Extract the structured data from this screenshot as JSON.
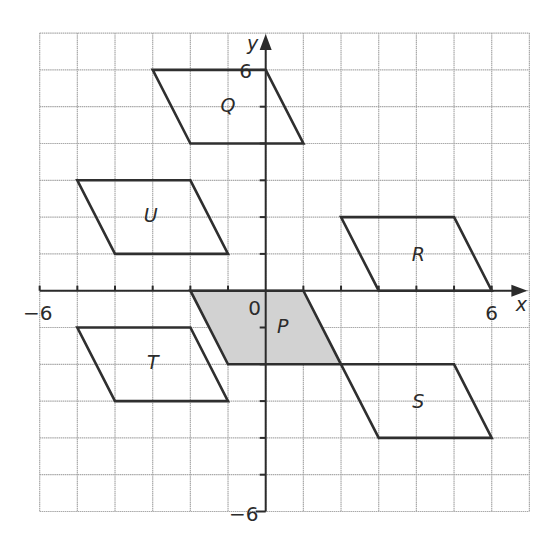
{
  "diagram": {
    "type": "coordinate-grid-transformations",
    "colors": {
      "background": "#ffffff",
      "grid_line": "#a9a9a9",
      "axis": "#2b2b2b",
      "shape_stroke": "#2f2f2f",
      "shaded_fill": "#d2d2d2",
      "text": "#2b2b2b"
    },
    "grid": {
      "x_min": -6,
      "x_max": 7,
      "y_min": -6,
      "y_max": 7,
      "origin_px": [
        265.7,
        290.7
      ],
      "cell_w_px": 37.67,
      "cell_h_px": 36.8
    },
    "axes": {
      "x_label": "x",
      "y_label": "y",
      "origin_label": "0",
      "x_tick_labels": [
        {
          "value": -6,
          "text": "−6"
        },
        {
          "value": 6,
          "text": "6"
        }
      ],
      "y_tick_labels": [
        {
          "value": 6,
          "text": "6"
        },
        {
          "value": -6,
          "text": "−6"
        }
      ]
    },
    "shapes": [
      {
        "name": "P",
        "shaded": true,
        "vertices": [
          [
            -2,
            0
          ],
          [
            1,
            0
          ],
          [
            2,
            -2
          ],
          [
            -1,
            -2
          ]
        ],
        "label_at": [
          0.45,
          -0.95
        ]
      },
      {
        "name": "Q",
        "shaded": false,
        "vertices": [
          [
            -3,
            6
          ],
          [
            0,
            6
          ],
          [
            1,
            4
          ],
          [
            -2,
            4
          ]
        ],
        "label_at": [
          -1.0,
          5.05
        ]
      },
      {
        "name": "R",
        "shaded": false,
        "vertices": [
          [
            2,
            2
          ],
          [
            5,
            2
          ],
          [
            6,
            0
          ],
          [
            3,
            0
          ]
        ],
        "label_at": [
          4.05,
          1.0
        ]
      },
      {
        "name": "S",
        "shaded": false,
        "vertices": [
          [
            2,
            -2
          ],
          [
            5,
            -2
          ],
          [
            6,
            -4
          ],
          [
            3,
            -4
          ]
        ],
        "label_at": [
          4.05,
          -3.0
        ]
      },
      {
        "name": "T",
        "shaded": false,
        "vertices": [
          [
            -5,
            -1
          ],
          [
            -2,
            -1
          ],
          [
            -1,
            -3
          ],
          [
            -4,
            -3
          ]
        ],
        "label_at": [
          -3.0,
          -1.95
        ]
      },
      {
        "name": "U",
        "shaded": false,
        "vertices": [
          [
            -5,
            3
          ],
          [
            -2,
            3
          ],
          [
            -1,
            1
          ],
          [
            -4,
            1
          ]
        ],
        "label_at": [
          -3.05,
          2.05
        ]
      }
    ]
  }
}
